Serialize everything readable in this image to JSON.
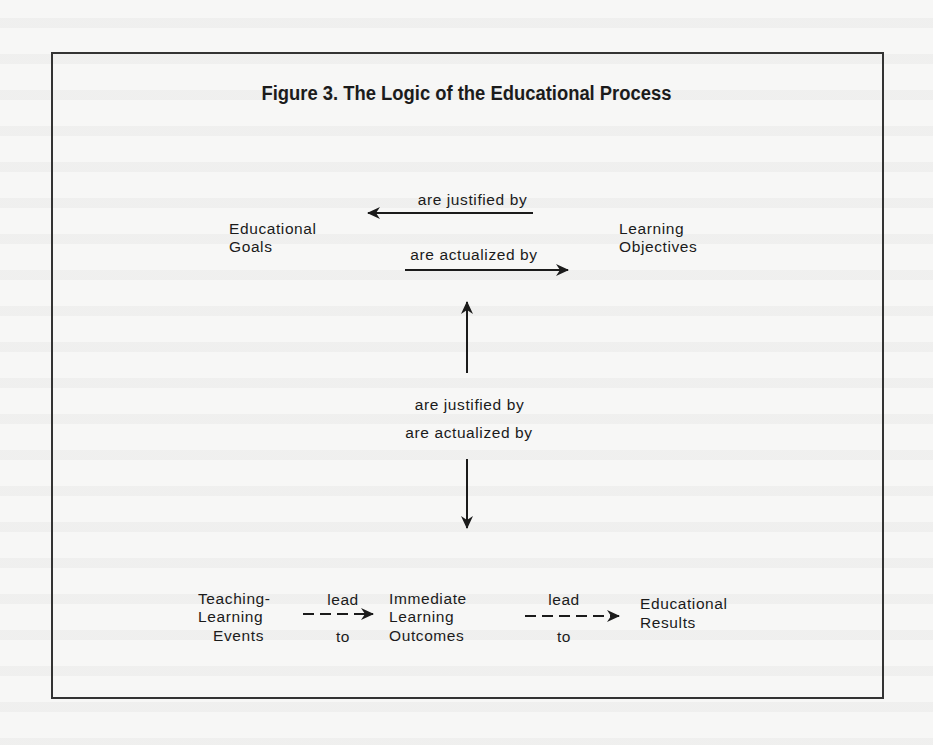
{
  "figure": {
    "title": "Figure 3. The Logic of the Educational Process"
  },
  "nodes": {
    "educational_goals": [
      "Educational",
      "Goals"
    ],
    "learning_objectives": [
      "Learning",
      "Objectives"
    ],
    "teaching_learning_events": [
      "Teaching-",
      "Learning",
      "Events"
    ],
    "immediate_learning_outcomes": [
      "Immediate",
      "Learning",
      "Outcomes"
    ],
    "educational_results": [
      "Educational",
      "Results"
    ]
  },
  "edges": {
    "objectives_to_goals": "are justified by",
    "goals_to_objectives": "are actualized by",
    "events_to_objectives": "are justified by",
    "objectives_to_events": "are actualized by",
    "events_to_outcomes": [
      "lead",
      "to"
    ],
    "outcomes_to_results": [
      "lead",
      "to"
    ]
  },
  "colors": {
    "ink": "#1b1b1b",
    "paper": "#f7f7f6",
    "frame": "#333333"
  }
}
